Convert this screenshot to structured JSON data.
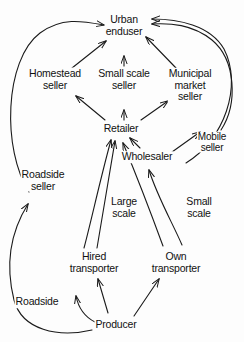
{
  "diagram": {
    "type": "flow-diagram",
    "background_color": "#fdfdfd",
    "line_color": "#1a1a1a",
    "nodes": [
      {
        "id": "urban-enduser",
        "label": "Urban\nenduser",
        "x": 124,
        "y": 25
      },
      {
        "id": "homestead-seller",
        "label": "Homestead\nseller",
        "x": 55,
        "y": 79
      },
      {
        "id": "small-scale-seller",
        "label": "Small scale\nseller",
        "x": 124,
        "y": 79
      },
      {
        "id": "municipal-seller",
        "label": "Municipal\nmarket\nseller",
        "x": 190,
        "y": 85
      },
      {
        "id": "retailer",
        "label": "Retailer",
        "x": 121,
        "y": 129
      },
      {
        "id": "wholesaler",
        "label": "Wholesaler",
        "x": 147,
        "y": 157
      },
      {
        "id": "mobile-seller",
        "label": "Mobile\nseller",
        "x": 212,
        "y": 142
      },
      {
        "id": "roadside-seller",
        "label": "Roadside\nseller",
        "x": 43,
        "y": 180
      },
      {
        "id": "large-scale",
        "label": "Large\nscale",
        "x": 124,
        "y": 207
      },
      {
        "id": "small-scale",
        "label": "Small\nscale",
        "x": 199,
        "y": 207
      },
      {
        "id": "hired-transporter",
        "label": "Hired\ntransporter",
        "x": 94,
        "y": 262
      },
      {
        "id": "own-transporter",
        "label": "Own\ntransporter",
        "x": 176,
        "y": 262
      },
      {
        "id": "roadside",
        "label": "Roadside",
        "x": 37,
        "y": 302
      },
      {
        "id": "producer",
        "label": "Producer",
        "x": 116,
        "y": 325
      }
    ],
    "edges": [
      {
        "id": "homestead-to-urban",
        "from": "homestead-seller",
        "to": "urban-enduser"
      },
      {
        "id": "small-scale-seller-to-urban",
        "from": "small-scale-seller",
        "to": "urban-enduser"
      },
      {
        "id": "municipal-to-urban",
        "from": "municipal-seller",
        "to": "urban-enduser"
      },
      {
        "id": "roadside-seller-to-urban",
        "from": "roadside-seller",
        "to": "urban-enduser"
      },
      {
        "id": "mobile-to-urban",
        "from": "mobile-seller",
        "to": "urban-enduser"
      },
      {
        "id": "wholesaler-right-to-urban",
        "from": "wholesaler",
        "to": "urban-enduser"
      },
      {
        "id": "retailer-to-homestead",
        "from": "retailer",
        "to": "homestead-seller"
      },
      {
        "id": "retailer-to-small-scale",
        "from": "retailer",
        "to": "small-scale-seller"
      },
      {
        "id": "retailer-to-municipal",
        "from": "retailer",
        "to": "municipal-seller"
      },
      {
        "id": "wholesaler-to-retailer",
        "from": "wholesaler",
        "to": "retailer"
      },
      {
        "id": "wholesaler-to-mobile",
        "from": "wholesaler",
        "to": "mobile-seller"
      },
      {
        "id": "hired-to-retailer",
        "from": "hired-transporter",
        "to": "retailer",
        "label": "Large scale"
      },
      {
        "id": "hired-to-wholesaler",
        "from": "hired-transporter",
        "to": "wholesaler"
      },
      {
        "id": "own-to-retailer",
        "from": "own-transporter",
        "to": "retailer"
      },
      {
        "id": "own-to-wholesaler",
        "from": "own-transporter",
        "to": "wholesaler",
        "label": "Small scale"
      },
      {
        "id": "producer-to-hired",
        "from": "producer",
        "to": "hired-transporter"
      },
      {
        "id": "producer-to-own",
        "from": "producer",
        "to": "own-transporter"
      },
      {
        "id": "producer-to-roadside",
        "from": "producer",
        "to": "roadside"
      },
      {
        "id": "producer-to-roadside-seller",
        "from": "producer",
        "to": "roadside-seller"
      }
    ]
  }
}
